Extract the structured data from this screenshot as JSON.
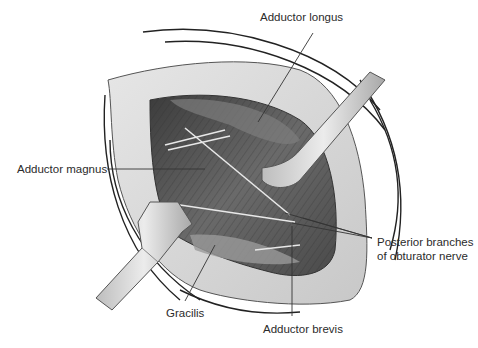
{
  "figure": {
    "labels": {
      "adductor_longus": "Adductor longus",
      "adductor_magnus": "Adductor magnus",
      "posterior_branches_line1": "Posterior branches",
      "posterior_branches_line2": "of obturator nerve",
      "gracilis": "Gracilis",
      "adductor_brevis": "Adductor brevis"
    },
    "colors": {
      "background": "#ffffff",
      "skin_edge": "#d9d9d9",
      "muscle_dark": "#4a4a4a",
      "muscle_mid": "#7a7a7a",
      "retractor": "#d0d0d0",
      "leader_line": "#333333",
      "text": "#2b2b2b"
    }
  }
}
